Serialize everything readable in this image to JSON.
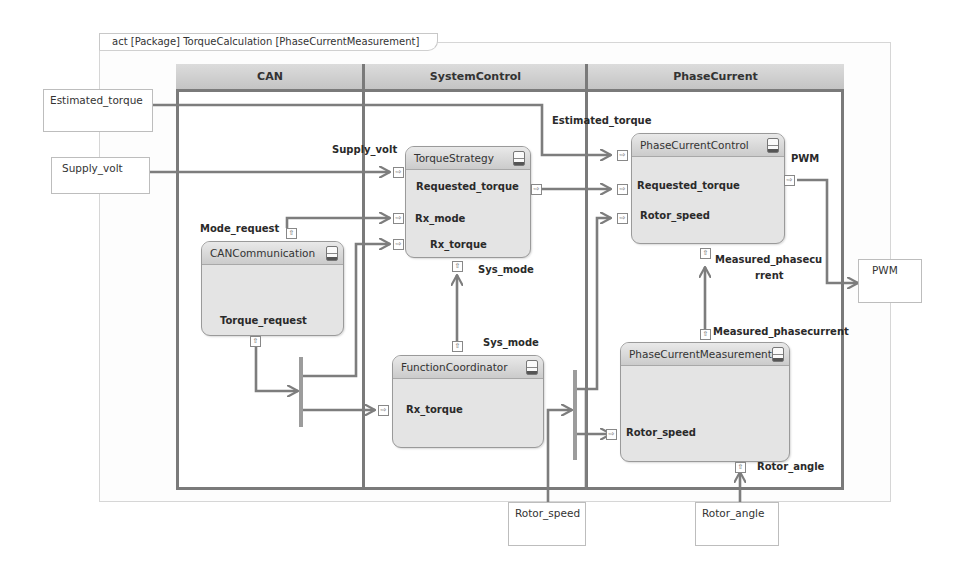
{
  "diagram": {
    "frame_title": "act [Package] TorqueCalculation [PhaseCurrentMeasurement]",
    "lanes": [
      {
        "name": "CAN"
      },
      {
        "name": "SystemControl"
      },
      {
        "name": "PhaseCurrent"
      }
    ],
    "external_parameters": {
      "estimated_torque": "Estimated_torque",
      "supply_volt": "Supply_volt",
      "pwm": "PWM",
      "rotor_speed": "Rotor_speed",
      "rotor_angle": "Rotor_angle"
    },
    "actions": {
      "can_communication": {
        "title": "CANCommunication",
        "pins": {
          "mode_request": "Mode_request",
          "torque_request": "Torque_request"
        }
      },
      "torque_strategy": {
        "title": "TorqueStrategy",
        "pins": {
          "supply_volt": "Supply_volt",
          "requested_torque": "Requested_torque",
          "rx_mode": "Rx_mode",
          "rx_torque": "Rx_torque",
          "sys_mode": "Sys_mode"
        }
      },
      "function_coordinator": {
        "title": "FunctionCoordinator",
        "pins": {
          "sys_mode": "Sys_mode",
          "rx_torque": "Rx_torque"
        }
      },
      "phase_current_control": {
        "title": "PhaseCurrentControl",
        "pins": {
          "estimated_torque": "Estimated_torque",
          "requested_torque": "Requested_torque",
          "rotor_speed": "Rotor_speed",
          "pwm": "PWM",
          "measured_phasecurrent_line1": "Measured_phasecu",
          "measured_phasecurrent_line2": "rrent"
        }
      },
      "phase_current_measurement": {
        "title": "PhaseCurrentMeasurement",
        "pins": {
          "measured_phasecurrent": "Measured_phasecurrent",
          "rotor_speed": "Rotor_speed",
          "rotor_angle": "Rotor_angle"
        }
      }
    },
    "port_glyphs": {
      "in": "⇨",
      "out": "⇨",
      "up": "⇧"
    },
    "colors": {
      "lane_border": "#7a7a7a",
      "lane_header": "#cfcfcf",
      "action_fill": "#e4e4e4",
      "wire": "#7d7d7d",
      "fork_bar": "#9c9c9c"
    }
  }
}
